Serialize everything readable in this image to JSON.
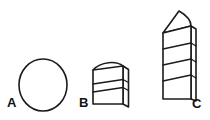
{
  "figure": {
    "background_color": "#ffffff",
    "line_color": "#1b1b1b",
    "fill_color": "#ffffff",
    "width": 210,
    "height": 120,
    "caption_labels": [
      {
        "id": "A",
        "text": "A",
        "x": 7,
        "y": 96
      },
      {
        "id": "B",
        "text": "B",
        "x": 79,
        "y": 96
      },
      {
        "id": "C",
        "text": "C",
        "x": 192,
        "y": 97
      }
    ],
    "shapes": [
      {
        "id": "A",
        "name": "circle-outline",
        "description": "plain circle outline, no internal divisions",
        "center_x": 43,
        "center_y": 85,
        "radius_x": 24,
        "radius_y": 26,
        "segments": 1,
        "has_side_face": false,
        "has_peak": false
      },
      {
        "id": "B",
        "name": "short-stacked-block-domed-top",
        "description": "short upright block with domed top, two slanted dividers, thin right side face",
        "left": 93,
        "right": 123,
        "top": 61,
        "bottom": 104,
        "segments": 3,
        "has_side_face": true,
        "side_face_width": 6,
        "has_peak": false,
        "dome_height": 8
      },
      {
        "id": "C",
        "name": "tall-stacked-block-pointed-top",
        "description": "tall upright block with pointed peaked top, four slanted dividers, thin right side face",
        "left": 163,
        "right": 191,
        "top": 31,
        "bottom": 99,
        "apex_x": 179,
        "apex_y": 11,
        "segments": 4,
        "has_side_face": true,
        "side_face_width": 5,
        "has_peak": true
      }
    ]
  }
}
